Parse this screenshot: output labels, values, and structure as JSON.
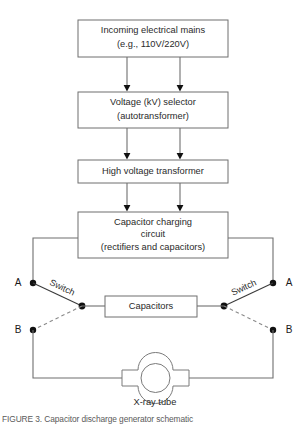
{
  "figure": {
    "caption": "FIGURE 3. Capacitor discharge generator schematic"
  },
  "blocks": [
    {
      "id": "mains",
      "lines": [
        "Incoming electrical mains",
        "(e.g., 110V/220V)"
      ]
    },
    {
      "id": "kv-selector",
      "lines": [
        "Voltage (kV) selector",
        "(autotransformer)"
      ]
    },
    {
      "id": "hv-transformer",
      "lines": [
        "High voltage transformer"
      ]
    },
    {
      "id": "charging-circuit",
      "lines": [
        "Capacitor charging",
        "circuit",
        "(rectifiers and capacitors)"
      ]
    },
    {
      "id": "capacitors",
      "lines": [
        "Capacitors"
      ]
    }
  ],
  "terminals": {
    "left_a": "A",
    "left_b": "B",
    "right_a": "A",
    "right_b": "B"
  },
  "switches": {
    "left_label": "Switch",
    "right_label": "Switch"
  },
  "tube": {
    "label": "X-ray tube"
  },
  "colors": {
    "box_stroke": "#6f6f6f",
    "wire": "#6f6f6f",
    "node": "#111111",
    "text": "#2a2a2a",
    "background": "#ffffff"
  }
}
